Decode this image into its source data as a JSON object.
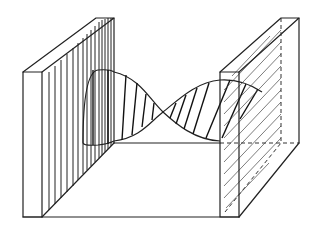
{
  "diagram": {
    "title": "",
    "description": "Light wave passing between two polarizing plates",
    "colors": {
      "line": "#222222",
      "background": "#ffffff"
    },
    "elements": [
      {
        "id": "left-plate",
        "label": "",
        "hatching": "vertical"
      },
      {
        "id": "right-plate",
        "label": "",
        "hatching": "diagonal",
        "edges_hidden": "dashed"
      },
      {
        "id": "wave",
        "label": "",
        "polarization_left": "vertical",
        "polarization_right": "diagonal"
      },
      {
        "id": "baseline",
        "label": ""
      }
    ],
    "labels": []
  }
}
